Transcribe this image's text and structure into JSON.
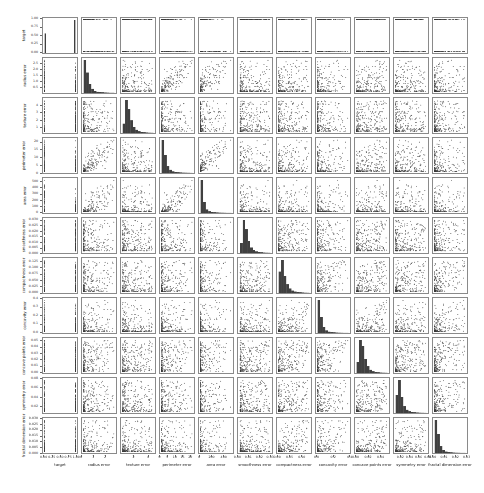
{
  "figure": {
    "background": "#ffffff",
    "width": 484,
    "height": 493
  },
  "chart_data": {
    "type": "scatter",
    "subtype": "pairplot-matrix",
    "title": "",
    "grid": {
      "rows": 11,
      "cols": 11
    },
    "n_points": 240,
    "point_color": "#3a3a3a",
    "point_alpha": 0.5,
    "hist_color": "#404040",
    "spine_color": "#8a8a8a",
    "layout": {
      "ml": 42,
      "mt": 17,
      "cw": 36,
      "ch": 37,
      "gap": 3
    },
    "variables": [
      {
        "label": "target",
        "range": [
          -0.05,
          1.05
        ],
        "extent": [
          0,
          1
        ],
        "ytick_vals": [
          0,
          0.25,
          0.5,
          0.75,
          1
        ],
        "ytick_labels": [
          "0.00",
          "0.25",
          "0.50",
          "0.75",
          "1.00"
        ],
        "xtick_vals": [
          0,
          0.25,
          0.5,
          0.75,
          1
        ],
        "xtick_labels": [
          "0.00",
          "0.25",
          "0.50",
          "0.75",
          "1.00"
        ],
        "hist": [
          0.59,
          0,
          0,
          0,
          0,
          0,
          0,
          0,
          0,
          0,
          0,
          0,
          0,
          0,
          0,
          0,
          0,
          0,
          0,
          0,
          0,
          0,
          0,
          1
        ],
        "dist": {
          "binary": true,
          "p1": 0.63,
          "load": 0.75
        }
      },
      {
        "label": "radius error",
        "range": [
          -0.03,
          3.01
        ],
        "extent": [
          0.11,
          2.87
        ],
        "ytick_vals": [
          0.5,
          1,
          1.5,
          2,
          2.5
        ],
        "ytick_labels": [
          "0.5",
          "1.0",
          "1.5",
          "2.0",
          "2.5"
        ],
        "xtick_vals": [
          0,
          1,
          2
        ],
        "xtick_labels": [
          "0",
          "1",
          "2"
        ],
        "hist": [
          1,
          0.62,
          0.27,
          0.12,
          0.055,
          0.03,
          0.018,
          0.01,
          0.006,
          0.004,
          0.002,
          0.002
        ],
        "dist": {
          "loadings": [
            0.95,
            0
          ],
          "p": 3.2
        }
      },
      {
        "label": "texture error",
        "range": [
          0.13,
          5.11
        ],
        "extent": [
          0.36,
          4.88
        ],
        "ytick_vals": [
          1,
          2,
          3,
          4
        ],
        "ytick_labels": [
          "1",
          "2",
          "3",
          "4"
        ],
        "xtick_vals": [
          2,
          4
        ],
        "xtick_labels": [
          "2",
          "4"
        ],
        "hist": [
          0.28,
          1,
          0.72,
          0.38,
          0.18,
          0.09,
          0.045,
          0.025,
          0.012,
          0.006,
          0.003,
          0.002
        ],
        "dist": {
          "loadings": [
            0.12,
            0.18
          ],
          "p": 2.1
        }
      },
      {
        "label": "perimeter error",
        "range": [
          -0.3,
          23.04
        ],
        "extent": [
          0.76,
          21.98
        ],
        "ytick_vals": [
          0,
          5,
          10,
          15,
          20
        ],
        "ytick_labels": [
          "0",
          "5",
          "10",
          "15",
          "20"
        ],
        "xtick_vals": [
          0,
          5,
          10,
          15,
          20
        ],
        "xtick_labels": [
          "0",
          "5",
          "10",
          "15",
          "20"
        ],
        "hist": [
          1,
          0.55,
          0.2,
          0.09,
          0.04,
          0.02,
          0.012,
          0.007,
          0.004,
          0.003,
          0.002,
          0.001
        ],
        "dist": {
          "loadings": [
            0.96,
            0
          ],
          "p": 3.4
        }
      },
      {
        "label": "area error",
        "range": [
          -20,
          569
        ],
        "extent": [
          6.8,
          542.2
        ],
        "ytick_vals": [
          0,
          100,
          200,
          300,
          400,
          500
        ],
        "ytick_labels": [
          "0",
          "100",
          "200",
          "300",
          "400",
          "500"
        ],
        "xtick_vals": [
          0,
          200,
          400
        ],
        "xtick_labels": [
          "0",
          "200",
          "400"
        ],
        "hist": [
          1,
          0.32,
          0.1,
          0.045,
          0.022,
          0.012,
          0.007,
          0.004,
          0.003,
          0.002,
          0.001,
          0.001
        ],
        "dist": {
          "loadings": [
            0.94,
            0
          ],
          "p": 5.5
        }
      },
      {
        "label": "smoothness error",
        "range": [
          -0.0004,
          0.0326
        ],
        "extent": [
          0.0017,
          0.0311
        ],
        "ytick_vals": [
          0,
          0.005,
          0.01,
          0.015,
          0.02,
          0.025,
          0.03
        ],
        "ytick_labels": [
          "0.000",
          "0.005",
          "0.010",
          "0.015",
          "0.020",
          "0.025",
          "0.030"
        ],
        "xtick_vals": [
          0,
          0.01,
          0.02,
          0.03
        ],
        "xtick_labels": [
          "0.00",
          "0.01",
          "0.02",
          "0.03"
        ],
        "hist": [
          0.3,
          1,
          0.72,
          0.36,
          0.16,
          0.08,
          0.04,
          0.02,
          0.01,
          0.005,
          0.003,
          0.002
        ],
        "dist": {
          "loadings": [
            0.08,
            0.3
          ],
          "p": 2.2
        }
      },
      {
        "label": "compactness error",
        "range": [
          -0.0047,
          0.1417
        ],
        "extent": [
          0.002,
          0.135
        ],
        "ytick_vals": [
          0,
          0.025,
          0.05,
          0.075,
          0.1,
          0.125
        ],
        "ytick_labels": [
          "0.000",
          "0.025",
          "0.050",
          "0.075",
          "0.100",
          "0.125"
        ],
        "xtick_vals": [
          0,
          0.05,
          0.1
        ],
        "xtick_labels": [
          "0.00",
          "0.05",
          "0.10"
        ],
        "hist": [
          0.65,
          1,
          0.52,
          0.26,
          0.13,
          0.065,
          0.035,
          0.02,
          0.01,
          0.006,
          0.003,
          0.002
        ],
        "dist": {
          "loadings": [
            0.35,
            0.72
          ],
          "p": 2.8
        }
      },
      {
        "label": "concavity error",
        "range": [
          -0.0198,
          0.4158
        ],
        "extent": [
          0,
          0.396
        ],
        "ytick_vals": [
          0,
          0.1,
          0.2,
          0.3,
          0.4
        ],
        "ytick_labels": [
          "0.0",
          "0.1",
          "0.2",
          "0.3",
          "0.4"
        ],
        "xtick_vals": [
          0,
          0.2,
          0.4
        ],
        "xtick_labels": [
          "0.0",
          "0.2",
          "0.4"
        ],
        "hist": [
          1,
          0.48,
          0.17,
          0.07,
          0.032,
          0.016,
          0.009,
          0.005,
          0.003,
          0.002,
          0.001,
          0.001
        ],
        "dist": {
          "loadings": [
            0.35,
            0.72
          ],
          "p": 4.5
        }
      },
      {
        "label": "concave points error",
        "range": [
          -0.0026,
          0.0554
        ],
        "extent": [
          0,
          0.0528
        ],
        "ytick_vals": [
          0,
          0.01,
          0.02,
          0.03,
          0.04,
          0.05
        ],
        "ytick_labels": [
          "0.00",
          "0.01",
          "0.02",
          "0.03",
          "0.04",
          "0.05"
        ],
        "xtick_vals": [
          0,
          0.02,
          0.04
        ],
        "xtick_labels": [
          "0.00",
          "0.02",
          "0.04"
        ],
        "hist": [
          0.32,
          1,
          0.82,
          0.42,
          0.2,
          0.09,
          0.045,
          0.022,
          0.011,
          0.005,
          0.003,
          0.002
        ],
        "dist": {
          "loadings": [
            0.45,
            0.58
          ],
          "p": 2.0
        }
      },
      {
        "label": "symmetry error",
        "range": [
          0.0043,
          0.0826
        ],
        "extent": [
          0.0079,
          0.079
        ],
        "ytick_vals": [
          0.02,
          0.04,
          0.06,
          0.08
        ],
        "ytick_labels": [
          "0.02",
          "0.04",
          "0.06",
          "0.08"
        ],
        "xtick_vals": [
          0.02,
          0.04,
          0.06,
          0.08
        ],
        "xtick_labels": [
          "0.02",
          "0.04",
          "0.06",
          "0.08"
        ],
        "hist": [
          0.55,
          1,
          0.48,
          0.2,
          0.09,
          0.045,
          0.022,
          0.012,
          0.006,
          0.003,
          0.002,
          0.001
        ],
        "dist": {
          "loadings": [
            0.2,
            0.45
          ],
          "p": 2.6
        }
      },
      {
        "label": "fractal dimension error",
        "range": [
          -0.0006,
          0.0312
        ],
        "extent": [
          0.0009,
          0.0298
        ],
        "ytick_vals": [
          0,
          0.005,
          0.01,
          0.015,
          0.02,
          0.025,
          0.03
        ],
        "ytick_labels": [
          "0.000",
          "0.005",
          "0.010",
          "0.015",
          "0.020",
          "0.025",
          "0.030"
        ],
        "xtick_vals": [
          0,
          0.01,
          0.02,
          0.03
        ],
        "xtick_labels": [
          "0.00",
          "0.01",
          "0.02",
          "0.03"
        ],
        "hist": [
          1,
          0.58,
          0.2,
          0.08,
          0.035,
          0.017,
          0.009,
          0.005,
          0.003,
          0.002,
          0.001,
          0.001
        ],
        "dist": {
          "loadings": [
            0.25,
            0.68
          ],
          "p": 4.0
        }
      }
    ]
  }
}
